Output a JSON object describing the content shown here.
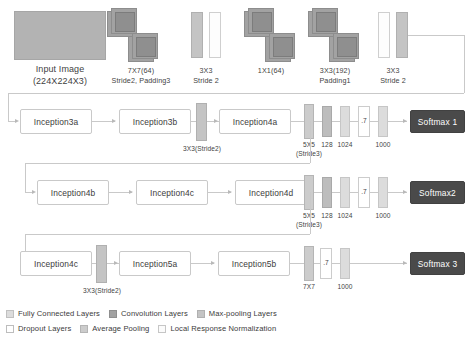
{
  "diagram": {
    "colors": {
      "fully_connected": "#dcdcdc",
      "convolution": "#a2a2a2",
      "max_pooling": "#c4c4c4",
      "dropout": "#ffffff",
      "average_pooling": "#cccccc",
      "local_response_normalization": "#fdfdfd",
      "softmax_box": "#4a4a4a",
      "wire": "#c9c9c9",
      "input_image": "#b3b3b3"
    }
  },
  "stem": {
    "input": {
      "line1": "Input Image",
      "line2": "(224X224X3)"
    },
    "conv1": {
      "line1": "7X7(64)",
      "line2": "Stride2, Padding3"
    },
    "pool1": {
      "line1": "3X3",
      "line2": "Stride 2"
    },
    "conv2": {
      "line1": "1X1(64)",
      "line2": ""
    },
    "conv3": {
      "line1": "3X3(192)",
      "line2": "Padding1"
    },
    "pool2": {
      "line1": "3X3",
      "line2": "Stride 2"
    }
  },
  "row1": {
    "blocks": [
      {
        "label": "Inception3a"
      },
      {
        "label": "Inception3b"
      },
      {
        "label": "Inception4a"
      }
    ],
    "pool_label": "3X3(Stride2)",
    "aux": {
      "pool": {
        "line1": "5X5",
        "line2": "(Stride3)"
      },
      "conv": "128",
      "fc": "1024",
      "dropout": ".7",
      "out": "1000",
      "softmax": "Softmax 1"
    }
  },
  "row2": {
    "blocks": [
      {
        "label": "Inception4b"
      },
      {
        "label": "Inception4c"
      },
      {
        "label": "Inception4d"
      }
    ],
    "aux": {
      "pool": {
        "line1": "5X5",
        "line2": "(Stride3)"
      },
      "conv": "128",
      "fc": "1024",
      "dropout": ".7",
      "out": "1000",
      "softmax": "Softmax2"
    }
  },
  "row3": {
    "blocks": [
      {
        "label": "Inception4c"
      },
      {
        "label": "Inception5a"
      },
      {
        "label": "Inception5b"
      }
    ],
    "pool_label": "3X3(Stride2)",
    "head": {
      "pool": "7X7",
      "dropout": ".7",
      "out": "1000",
      "softmax": "Softmax 3"
    }
  },
  "legend": {
    "row1": [
      {
        "name": "fully-connected-layers",
        "label": "Fully Connected Layers",
        "color": "#dcdcdc",
        "border": "#c0c0c0"
      },
      {
        "name": "convolution-layers",
        "label": "Convolution Layers",
        "color": "#a2a2a2",
        "border": "#8f8f8f"
      },
      {
        "name": "max-pooling-layers",
        "label": "Max-pooling Layers",
        "color": "#c4c4c4",
        "border": "#b0b0b0"
      }
    ],
    "row2": [
      {
        "name": "dropout-layers",
        "label": "Dropout Layers",
        "color": "#ffffff",
        "border": "#bdbdbd"
      },
      {
        "name": "average-pooling",
        "label": "Average Pooling",
        "color": "#cccccc",
        "border": "#b5b5b5"
      },
      {
        "name": "local-response-normalization",
        "label": "Local Response Normalization",
        "color": "#fbfbfb",
        "border": "#c6c6c6"
      }
    ]
  }
}
